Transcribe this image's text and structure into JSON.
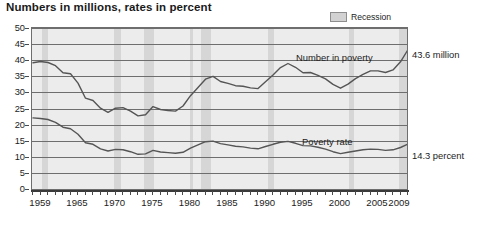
{
  "title": "Numbers in millions, rates in percent",
  "legend": {
    "position": "top-right",
    "items": [
      {
        "label": "Recession",
        "swatch_color": "#d2d2d2",
        "icon": "recession-swatch-icon"
      }
    ]
  },
  "annotations": {
    "number_in_poverty": "Number in poverty",
    "poverty_rate": "Poverty rate",
    "right_number_value": "43.6 million",
    "right_rate_value": "14.3 percent"
  },
  "colors": {
    "plot_background": "#ececec",
    "recession_band": "#d6d6d6",
    "gridline": "#6e6e6e",
    "series_line": "#555555",
    "axis": "#3a3a3a",
    "text": "#1c1c1c"
  },
  "chart_data": {
    "type": "line",
    "title": "Numbers in millions, rates in percent",
    "xlabel": "",
    "ylabel": "",
    "xlim": [
      1959,
      2009
    ],
    "ylim": [
      0,
      50
    ],
    "ytick_values": [
      0,
      5,
      10,
      15,
      20,
      25,
      30,
      35,
      40,
      45,
      50
    ],
    "ytick_labels": [
      "0",
      "5",
      "10",
      "15",
      "20",
      "25",
      "30",
      "35",
      "40",
      "45",
      "50"
    ],
    "xtick_labels": [
      "1959",
      "1965",
      "1970",
      "1975",
      "1980",
      "1985",
      "1990",
      "1995",
      "2000",
      "2005",
      "2009"
    ],
    "xtick_label_years": [
      1959,
      1965,
      1970,
      1975,
      1980,
      1985,
      1990,
      1995,
      2000,
      2005,
      2009
    ],
    "xtick_minor_every": 1,
    "grid": true,
    "grid_axis": "y",
    "legend_position": "top-right",
    "x": [
      1959,
      1960,
      1961,
      1962,
      1963,
      1964,
      1965,
      1966,
      1967,
      1968,
      1969,
      1970,
      1971,
      1972,
      1973,
      1974,
      1975,
      1976,
      1977,
      1978,
      1979,
      1980,
      1981,
      1982,
      1983,
      1984,
      1985,
      1986,
      1987,
      1988,
      1989,
      1990,
      1991,
      1992,
      1993,
      1994,
      1995,
      1996,
      1997,
      1998,
      1999,
      2000,
      2001,
      2002,
      2003,
      2004,
      2005,
      2006,
      2007,
      2008,
      2009
    ],
    "series": [
      {
        "name": "Number in poverty",
        "units": "millions",
        "end_label": "43.6 million",
        "values": [
          39.5,
          39.9,
          39.6,
          38.6,
          36.4,
          36.1,
          33.2,
          28.5,
          27.8,
          25.4,
          24.1,
          25.4,
          25.6,
          24.5,
          23.0,
          23.4,
          25.9,
          25.0,
          24.7,
          24.5,
          26.1,
          29.3,
          31.8,
          34.4,
          35.3,
          33.7,
          33.1,
          32.4,
          32.2,
          31.7,
          31.5,
          33.6,
          35.7,
          38.0,
          39.3,
          38.1,
          36.4,
          36.5,
          35.6,
          34.5,
          32.8,
          31.6,
          32.9,
          34.6,
          35.9,
          37.0,
          37.0,
          36.5,
          37.3,
          39.8,
          43.6
        ]
      },
      {
        "name": "Poverty rate",
        "units": "percent",
        "end_label": "14.3 percent",
        "values": [
          22.4,
          22.2,
          21.9,
          21.0,
          19.5,
          19.0,
          17.3,
          14.7,
          14.2,
          12.8,
          12.1,
          12.6,
          12.5,
          11.9,
          11.1,
          11.2,
          12.3,
          11.8,
          11.6,
          11.4,
          11.7,
          13.0,
          14.0,
          15.0,
          15.2,
          14.4,
          14.0,
          13.6,
          13.4,
          13.0,
          12.8,
          13.5,
          14.2,
          14.8,
          15.1,
          14.5,
          13.8,
          13.7,
          13.3,
          12.7,
          11.9,
          11.3,
          11.7,
          12.1,
          12.5,
          12.7,
          12.6,
          12.3,
          12.5,
          13.2,
          14.3
        ]
      }
    ],
    "recessions": [
      {
        "start": 1960.3,
        "end": 1961.1
      },
      {
        "start": 1969.9,
        "end": 1970.9
      },
      {
        "start": 1973.9,
        "end": 1975.2
      },
      {
        "start": 1980.0,
        "end": 1980.5
      },
      {
        "start": 1981.5,
        "end": 1982.9
      },
      {
        "start": 1990.5,
        "end": 1991.2
      },
      {
        "start": 2001.2,
        "end": 2001.9
      },
      {
        "start": 2007.9,
        "end": 2009.5
      }
    ]
  }
}
